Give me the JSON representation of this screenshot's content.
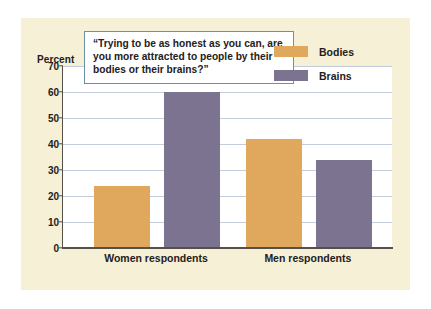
{
  "figure": {
    "percent_axis_label": "Percent",
    "callout_quote": "“Trying to be as honest as you can, are you more attracted to people by their bodies or their brains?”"
  },
  "colors": {
    "card_background": "#f6f0d6",
    "plot_background": "#ffffff",
    "bodies": "#dfa85c",
    "brains": "#7c7391",
    "gridline": "#c2ccdb",
    "axis": "#55504a",
    "callout_border": "#6a93a8",
    "text": "#23201c"
  },
  "chart_data": {
    "type": "bar",
    "title": "",
    "subtitle": "",
    "annotations": [
      "“Trying to be as honest as you can, are you more attracted to people by their bodies or their brains?”"
    ],
    "categories": [
      "Women respondents",
      "Men respondents"
    ],
    "series": [
      {
        "name": "Bodies",
        "values": [
          24,
          42
        ],
        "color": "#dfa85c"
      },
      {
        "name": "Brains",
        "values": [
          60,
          34
        ],
        "color": "#7c7391"
      }
    ],
    "xlabel": "",
    "ylabel": "Percent",
    "ylim": [
      0,
      70
    ],
    "yticks": [
      0,
      10,
      20,
      30,
      40,
      50,
      60,
      70
    ],
    "ytick_labels": [
      "0",
      "10",
      "20",
      "30",
      "40",
      "50",
      "60",
      "70"
    ],
    "grid": true,
    "grid_axis": "y",
    "legend": true,
    "legend_position": "top-right",
    "legend_entries": [
      "Bodies",
      "Brains"
    ]
  }
}
